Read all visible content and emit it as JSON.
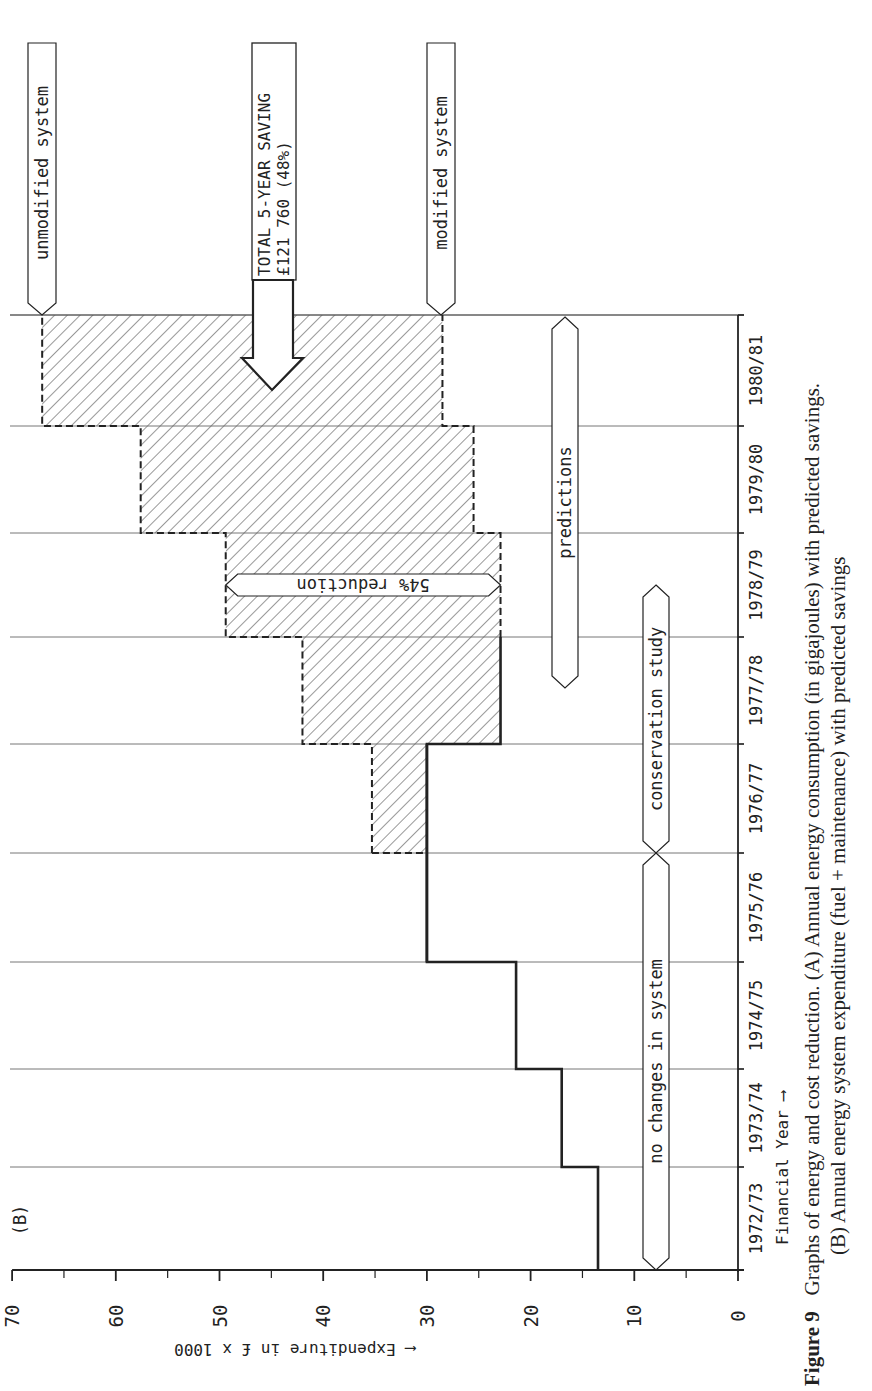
{
  "chart_data": {
    "type": "step",
    "orientation": "rotated-90-ccw",
    "panel_label": "(B)",
    "xlabel": "Financial Year",
    "ylabel": "Expenditure in £ x 1000",
    "ylim": [
      0,
      70
    ],
    "yticks": [
      0,
      10,
      20,
      30,
      40,
      50,
      60,
      70
    ],
    "categories": [
      "1972/73",
      "1973/74",
      "1974/75",
      "1975/76",
      "1976/77",
      "1977/78",
      "1978/79",
      "1979/80",
      "1980/81"
    ],
    "series": [
      {
        "name": "actual expenditure (no changes in system)",
        "style": "solid",
        "values": [
          13.5,
          17,
          21.4,
          30,
          30,
          null,
          null,
          null,
          null
        ]
      },
      {
        "name": "unmodified system (predicted)",
        "style": "dashed",
        "values": [
          null,
          null,
          null,
          null,
          35.3,
          42,
          49.4,
          57.6,
          67.1
        ]
      },
      {
        "name": "modified system (predicted)",
        "style": "dashed",
        "values": [
          null,
          null,
          null,
          null,
          30,
          22.9,
          22.9,
          25.5,
          28.5
        ]
      }
    ],
    "shaded_region": "savings between unmodified and modified system, 1976/77–1980/81 (hatched)",
    "annotations": [
      {
        "text": "unmodified system",
        "points_to": "1980/81 top of unmodified line"
      },
      {
        "text": "TOTAL 5-YEAR SAVING",
        "subtext": "£121 760 (48%)",
        "type": "down-arrow"
      },
      {
        "text": "modified system",
        "points_to": "1980/81 top of modified line"
      },
      {
        "text": "54% reduction",
        "span_years": "1978/79",
        "type": "double-arrow"
      },
      {
        "text": "predictions",
        "span": [
          "1977/78",
          "1980/81"
        ]
      },
      {
        "text": "conservation study",
        "span": [
          "1976/77",
          "1977/78"
        ]
      },
      {
        "text": "no changes in system",
        "span": [
          "1972/73",
          "1975/76"
        ]
      }
    ]
  },
  "labels": {
    "panel": "(B)",
    "unmodified": "unmodified system",
    "modified": "modified system",
    "total_line1": "TOTAL 5-YEAR SAVING",
    "total_line2": "£121 760 (48%)",
    "reduction": "54% reduction",
    "predictions": "predictions",
    "conservation": "conservation study",
    "nochange": "no changes in system",
    "xaxis": "Financial Year ⟶",
    "yaxis": "⟵ Expenditure in £ x 1000"
  },
  "caption": {
    "figure": "Figure 9",
    "line1": "Graphs of energy and cost reduction. (A) Annual energy consumption (in gigajoules) with predicted savings.",
    "line2": "(B) Annual energy system expenditure (fuel + maintenance) with predicted savings"
  },
  "colors": {
    "ink": "#222222",
    "background": "#ffffff",
    "grid": "#555555"
  }
}
